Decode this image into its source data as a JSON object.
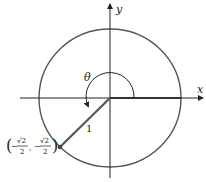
{
  "diagram": {
    "type": "unit-circle",
    "axes": {
      "x_label": "x",
      "y_label": "y"
    },
    "angle_label": "θ",
    "radius_label": "1",
    "point": {
      "x_num": "√2",
      "x_den": "2",
      "y_num": "√2",
      "y_den": "2",
      "x_sign": "−",
      "y_sign": "−",
      "open_paren": "(",
      "close_paren": ")",
      "comma": ","
    },
    "colors": {
      "circle": "#555555",
      "axes": "#222222",
      "terminal_side": "#555555",
      "point": "#444444"
    }
  }
}
